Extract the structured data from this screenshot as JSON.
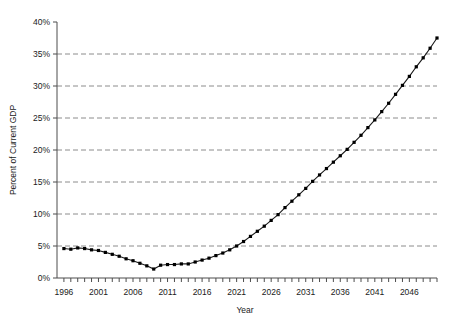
{
  "chart_data": {
    "type": "line",
    "title": "",
    "xlabel": "Year",
    "ylabel": "Percent of Current GDP",
    "xlim": [
      1995,
      2050
    ],
    "ylim": [
      0,
      40
    ],
    "grid": true,
    "legend": false,
    "y_tick_labels": [
      "0%",
      "5%",
      "10%",
      "15%",
      "20%",
      "25%",
      "30%",
      "35%",
      "40%"
    ],
    "y_ticks": [
      0,
      5,
      10,
      15,
      20,
      25,
      30,
      35,
      40
    ],
    "x_tick_labels": [
      "1996",
      "2001",
      "2006",
      "2011",
      "2016",
      "2021",
      "2026",
      "2031",
      "2036",
      "2041",
      "2046"
    ],
    "x_ticks": [
      1996,
      2001,
      2006,
      2011,
      2016,
      2021,
      2026,
      2031,
      2036,
      2041,
      2046
    ],
    "marker": "square",
    "marker_color": "#000000",
    "line_color": "#1a1a1a",
    "x": [
      1996,
      1997,
      1998,
      1999,
      2000,
      2001,
      2002,
      2003,
      2004,
      2005,
      2006,
      2007,
      2008,
      2009,
      2010,
      2011,
      2012,
      2013,
      2014,
      2015,
      2016,
      2017,
      2018,
      2019,
      2020,
      2021,
      2022,
      2023,
      2024,
      2025,
      2026,
      2027,
      2028,
      2029,
      2030,
      2031,
      2032,
      2033,
      2034,
      2035,
      2036,
      2037,
      2038,
      2039,
      2040,
      2041,
      2042,
      2043,
      2044,
      2045,
      2046,
      2047,
      2048,
      2049,
      2050
    ],
    "values": [
      4.6,
      4.5,
      4.7,
      4.6,
      4.4,
      4.3,
      4.0,
      3.7,
      3.4,
      3.0,
      2.7,
      2.3,
      1.9,
      1.4,
      2.0,
      2.1,
      2.1,
      2.2,
      2.2,
      2.5,
      2.8,
      3.1,
      3.5,
      3.9,
      4.4,
      5.0,
      5.7,
      6.5,
      7.3,
      8.1,
      9.0,
      9.9,
      11.0,
      12.0,
      13.0,
      14.0,
      15.1,
      16.1,
      17.1,
      18.1,
      19.1,
      20.1,
      21.2,
      22.3,
      23.5,
      24.7,
      26.0,
      27.3,
      28.7,
      30.1,
      31.5,
      33.0,
      34.4,
      35.9,
      37.5
    ]
  }
}
